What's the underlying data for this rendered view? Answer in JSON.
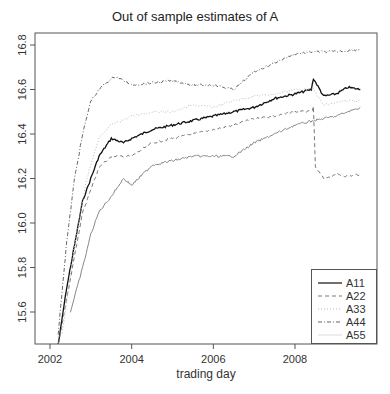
{
  "chart_data": {
    "type": "line",
    "title": "Out of sample estimates of A",
    "xlabel": "trading day",
    "ylabel": "",
    "xlim": [
      2001.6,
      2009.95
    ],
    "ylim": [
      15.456,
      16.854
    ],
    "x_ticks": [
      "2002",
      "2004",
      "2006",
      "2008"
    ],
    "y_ticks": [
      "15.6",
      "15.8",
      "16.0",
      "16.2",
      "16.4",
      "16.6",
      "16.8"
    ],
    "grid": false,
    "legend_position": "bottom-right",
    "series": [
      {
        "name": "A11",
        "style": "solid",
        "color": "#111111",
        "x": [
          2002.2,
          2002.4,
          2002.6,
          2002.8,
          2002.9,
          2003.0,
          2003.2,
          2003.5,
          2003.8,
          2004.0,
          2004.5,
          2005.0,
          2005.5,
          2006.0,
          2006.5,
          2007.0,
          2007.5,
          2008.0,
          2008.4,
          2008.45,
          2008.7,
          2009.0,
          2009.3,
          2009.6
        ],
        "y": [
          15.45,
          15.7,
          15.9,
          16.1,
          16.15,
          16.2,
          16.3,
          16.38,
          16.36,
          16.38,
          16.42,
          16.44,
          16.46,
          16.48,
          16.5,
          16.52,
          16.56,
          16.58,
          16.6,
          16.65,
          16.57,
          16.58,
          16.61,
          16.6
        ]
      },
      {
        "name": "A22",
        "style": "dashed",
        "color": "#777777",
        "x": [
          2002.2,
          2002.4,
          2002.6,
          2002.8,
          2003.0,
          2003.2,
          2003.5,
          2004.0,
          2004.5,
          2005.0,
          2005.5,
          2006.0,
          2006.5,
          2007.0,
          2007.5,
          2008.0,
          2008.4,
          2008.45,
          2008.5,
          2008.7,
          2009.0,
          2009.3,
          2009.6
        ],
        "y": [
          15.45,
          15.65,
          15.85,
          16.05,
          16.15,
          16.25,
          16.3,
          16.3,
          16.36,
          16.38,
          16.4,
          16.42,
          16.44,
          16.47,
          16.48,
          16.5,
          16.5,
          16.52,
          16.25,
          16.2,
          16.22,
          16.21,
          16.22
        ]
      },
      {
        "name": "A33",
        "style": "dotted",
        "color": "#bbbbbb",
        "x": [
          2002.3,
          2002.6,
          2002.9,
          2003.2,
          2003.5,
          2004.0,
          2004.5,
          2005.0,
          2005.5,
          2006.0,
          2006.5,
          2007.0,
          2007.5,
          2008.0,
          2008.45,
          2008.7,
          2009.0,
          2009.3,
          2009.6
        ],
        "y": [
          15.5,
          15.9,
          16.2,
          16.38,
          16.44,
          16.48,
          16.5,
          16.5,
          16.53,
          16.52,
          16.55,
          16.57,
          16.58,
          16.6,
          16.6,
          16.53,
          16.54,
          16.55,
          16.55
        ]
      },
      {
        "name": "A44",
        "style": "dashdot",
        "color": "#666666",
        "x": [
          2002.2,
          2002.4,
          2002.6,
          2002.8,
          2003.0,
          2003.3,
          2003.6,
          2004.0,
          2004.5,
          2005.0,
          2005.5,
          2006.0,
          2006.5,
          2007.0,
          2007.5,
          2008.0,
          2008.45,
          2009.0,
          2009.6
        ],
        "y": [
          15.5,
          15.9,
          16.2,
          16.4,
          16.55,
          16.62,
          16.66,
          16.62,
          16.63,
          16.64,
          16.62,
          16.62,
          16.6,
          16.68,
          16.72,
          16.76,
          16.77,
          16.77,
          16.78
        ]
      },
      {
        "name": "A55",
        "style": "solid-light",
        "color": "#888888",
        "x": [
          2002.5,
          2002.8,
          2003.0,
          2003.2,
          2003.5,
          2003.8,
          2004.0,
          2004.5,
          2005.0,
          2005.5,
          2006.0,
          2006.5,
          2007.0,
          2007.5,
          2008.0,
          2008.45,
          2009.0,
          2009.6
        ],
        "y": [
          15.6,
          15.8,
          15.95,
          16.05,
          16.12,
          16.2,
          16.17,
          16.26,
          16.28,
          16.3,
          16.3,
          16.3,
          16.36,
          16.4,
          16.44,
          16.46,
          16.48,
          16.52
        ]
      }
    ]
  },
  "legend": {
    "items": [
      {
        "label": "A11"
      },
      {
        "label": "A22"
      },
      {
        "label": "A33"
      },
      {
        "label": "A44"
      },
      {
        "label": "A55"
      }
    ]
  }
}
